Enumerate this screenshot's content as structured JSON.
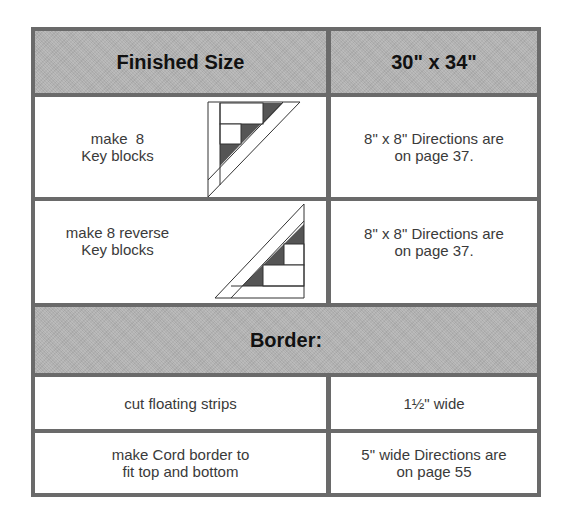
{
  "header": {
    "label": "Finished Size",
    "value": "30\" x 34\""
  },
  "rows": [
    {
      "left_line1": "make  8",
      "left_line2": "Key blocks",
      "right_line1": "8\" x 8\" Directions are",
      "right_line2": "on page 37.",
      "icon": "key-block-icon"
    },
    {
      "left_line1": "make 8 reverse",
      "left_line2": "Key blocks",
      "right_line1": "8\" x 8\" Directions are",
      "right_line2": "on page 37.",
      "icon": "reverse-key-block-icon"
    }
  ],
  "section": {
    "title": "Border:"
  },
  "border_rows": [
    {
      "left_line1": "cut floating strips",
      "right_line1": "1½\" wide"
    },
    {
      "left_line1": "make Cord border to",
      "left_line2": "fit top and bottom",
      "right_line1": "5\" wide Directions are",
      "right_line2": "on page 55"
    }
  ],
  "colors": {
    "border": "#6a6a6a",
    "header_fill": "#b3b3b3",
    "dark_patch": "#555555"
  }
}
